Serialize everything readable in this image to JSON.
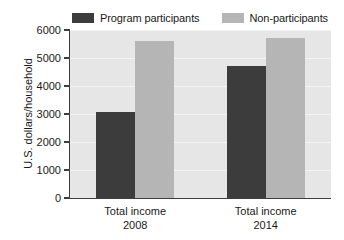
{
  "chart_data": {
    "type": "bar",
    "title": "",
    "xlabel": "",
    "ylabel": "U.S. dollars/household",
    "ylim": [
      0,
      6000
    ],
    "yticks": [
      0,
      1000,
      2000,
      3000,
      4000,
      5000,
      6000
    ],
    "ytick_labels": [
      "0",
      "1000",
      "2000",
      "3000",
      "4000",
      "5000",
      "6000"
    ],
    "grid": false,
    "legend_position": "top",
    "categories": [
      "Total income\n2008",
      "Total income\n2014"
    ],
    "category_lines": [
      {
        "line1": "Total income",
        "line2": "2008"
      },
      {
        "line1": "Total income",
        "line2": "2014"
      }
    ],
    "series": [
      {
        "name": "Program participants",
        "color": "#3c3c3c",
        "values": [
          3060,
          4730
        ]
      },
      {
        "name": "Non-participants",
        "color": "#b5b5b5",
        "values": [
          5620,
          5700
        ]
      }
    ]
  },
  "legend": {
    "entries": [
      {
        "label": "Program participants",
        "color": "#3c3c3c"
      },
      {
        "label": "Non-participants",
        "color": "#b5b5b5"
      }
    ]
  },
  "axes": {
    "y_title": "U.S. dollars/household",
    "y_tick_labels": [
      "6000",
      "5000",
      "4000",
      "3000",
      "2000",
      "1000",
      "0"
    ],
    "x_group_labels": [
      {
        "line1": "Total income",
        "line2": "2008"
      },
      {
        "line1": "Total income",
        "line2": "2014"
      }
    ]
  },
  "colors": {
    "figure_background": "#ffffff",
    "plot_background": "#e6e6e6",
    "axis": "#3d3d3d",
    "series_dark": "#3c3c3c",
    "series_light": "#b5b5b5",
    "text": "#1a1a1a"
  }
}
